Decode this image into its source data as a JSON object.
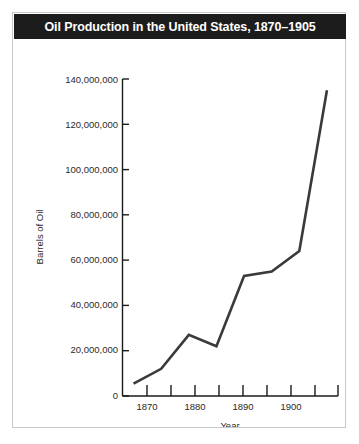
{
  "figure": {
    "title": "Oil Production in the United States, 1870–1905",
    "title_bar_color": "#1c1c1c",
    "title_text_color": "#ffffff",
    "border_color": "#c9c9c9",
    "background_color": "#ffffff"
  },
  "chart_data": {
    "type": "line",
    "title": "Oil Production in the United States, 1870–1905",
    "xlabel": "Year",
    "ylabel": "Barrels of Oil",
    "x": [
      1870,
      1875,
      1880,
      1885,
      1890,
      1895,
      1900,
      1905
    ],
    "values": [
      5500000,
      12000000,
      27000000,
      22000000,
      53000000,
      55000000,
      64000000,
      135000000
    ],
    "series": [
      {
        "name": "Oil Production",
        "values": [
          5500000,
          12000000,
          27000000,
          22000000,
          53000000,
          55000000,
          64000000,
          135000000
        ]
      }
    ],
    "xlim": [
      1868,
      1907
    ],
    "ylim": [
      0,
      140000000
    ],
    "x_major_ticks": [
      1870,
      1880,
      1890,
      1900
    ],
    "x_minor_ticks": [
      1875,
      1885,
      1895,
      1905
    ],
    "x_tick_labels": [
      "1870",
      "1880",
      "1890",
      "1900"
    ],
    "y_ticks": [
      0,
      20000000,
      40000000,
      60000000,
      80000000,
      100000000,
      120000000,
      140000000
    ],
    "y_tick_labels": [
      "0",
      "20,000,000",
      "40,000,000",
      "60,000,000",
      "80,000,000",
      "100,000,000",
      "120,000,000",
      "140,000,000"
    ],
    "grid": false,
    "legend": false,
    "line_color": "#3a3a3a"
  }
}
